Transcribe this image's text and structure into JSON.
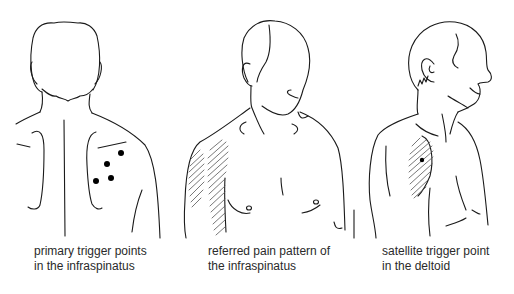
{
  "figures": [
    {
      "id": "back-view",
      "caption_line1": "primary trigger points",
      "caption_line2": "in the infraspinatus",
      "marker_type": "dots",
      "marker_count": 4
    },
    {
      "id": "front-view",
      "caption_line1": "referred pain pattern of",
      "caption_line2": "the infraspinatus",
      "marker_type": "hatched-area"
    },
    {
      "id": "side-view",
      "caption_line1": "satellite trigger point",
      "caption_line2": "in the deltoid",
      "marker_type": "hatched-area-with-dot",
      "marker_count": 1
    }
  ],
  "colors": {
    "line": "#1a1a1a",
    "hatch": "#555555",
    "dot": "#000000",
    "text": "#2a2a2a",
    "background": "#ffffff"
  }
}
